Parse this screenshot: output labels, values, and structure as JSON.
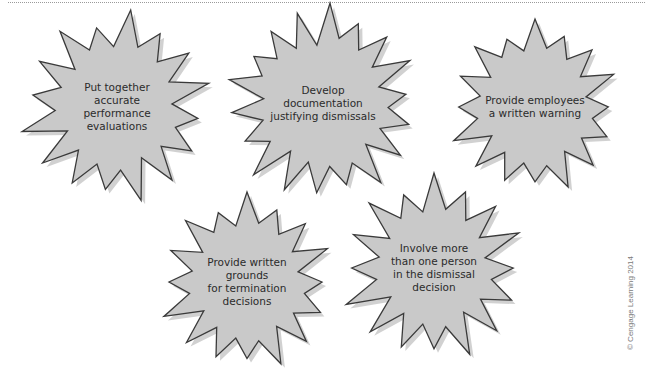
{
  "diagram": {
    "colors": {
      "fill": "#c9c9c9",
      "stroke": "#3a3a3a",
      "shadow": "#9a9a9a",
      "text": "#2b2b2b"
    },
    "bursts": [
      {
        "id": "performance-evaluations",
        "label": "Put together\naccurate\nperformance\nevaluations",
        "cx": 117,
        "cy": 107,
        "r_outer": 98,
        "r_inner": 55,
        "points": 16,
        "text_w": 90,
        "text_h": 60
      },
      {
        "id": "documentation",
        "label": "Develop\ndocumentation\njustifying dismissals",
        "cx": 323,
        "cy": 103,
        "r_outer": 100,
        "r_inner": 58,
        "points": 18,
        "text_w": 130,
        "text_h": 48
      },
      {
        "id": "written-warning",
        "label": "Provide employees\na written warning",
        "cx": 535,
        "cy": 107,
        "r_outer": 88,
        "r_inner": 52,
        "points": 16,
        "text_w": 120,
        "text_h": 34
      },
      {
        "id": "written-grounds",
        "label": "Provide written\ngrounds\nfor termination\ndecisions",
        "cx": 247,
        "cy": 282,
        "r_outer": 90,
        "r_inner": 52,
        "points": 16,
        "text_w": 110,
        "text_h": 60
      },
      {
        "id": "multiple-people",
        "label": "Involve more\nthan one person\nin the dismissal\ndecision",
        "cx": 434,
        "cy": 268,
        "r_outer": 95,
        "r_inner": 52,
        "points": 16,
        "text_w": 110,
        "text_h": 60
      }
    ]
  },
  "credit": "© Cengage Learning 2014"
}
